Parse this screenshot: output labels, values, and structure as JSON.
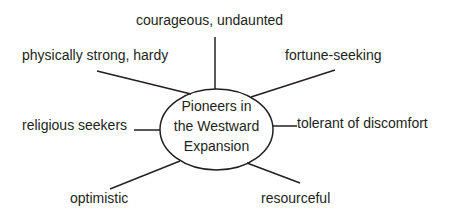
{
  "diagram": {
    "type": "concept-web",
    "center": {
      "lines": [
        "Pioneers in",
        "the Westward",
        "Expansion"
      ]
    },
    "nodes": [
      {
        "position": "top",
        "label": "courageous, undaunted"
      },
      {
        "position": "upper-left",
        "label": "physically strong, hardy"
      },
      {
        "position": "upper-right",
        "label": "fortune-seeking"
      },
      {
        "position": "left",
        "label": "religious seekers"
      },
      {
        "position": "right",
        "label": "tolerant of discomfort"
      },
      {
        "position": "lower-left",
        "label": "optimistic"
      },
      {
        "position": "lower-right",
        "label": "resourceful"
      }
    ],
    "colors": {
      "stroke": "#231f20",
      "text": "#231f20",
      "background": "#ffffff"
    }
  }
}
